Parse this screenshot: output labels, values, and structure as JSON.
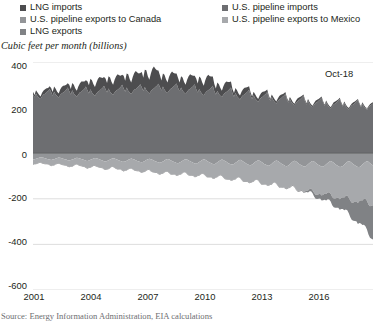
{
  "legend": {
    "items": [
      {
        "label": "LNG imports",
        "color": "#4d4d4f",
        "marker": "legend-swatch"
      },
      {
        "label": "U.S. pipeline exports to Canada",
        "color": "#939598",
        "marker": "legend-swatch"
      },
      {
        "label": "LNG exports",
        "color": "#808285",
        "marker": "legend-swatch"
      },
      {
        "label": "U.S. pipeline imports",
        "color": "#6d6e71",
        "marker": "legend-swatch"
      },
      {
        "label": "U.S. pipeline exports to Mexico",
        "color": "#a7a9ac",
        "marker": "legend-swatch"
      }
    ]
  },
  "axis_title": "Cubic feet per month (billions)",
  "annotation": "Oct-18",
  "source": "Source: Energy Information Administration, EIA calculations",
  "chart_data": {
    "type": "area",
    "stacked": true,
    "title": "",
    "subtitle": "",
    "xlabel": "",
    "ylabel": "Cubic feet per month (billions)",
    "ylim": [
      -600,
      400
    ],
    "xlim": [
      2001,
      2018.83
    ],
    "grid": true,
    "legend_position": "top",
    "ytick_labels": [
      "400",
      "200",
      "0",
      "-200",
      "-400",
      "-600"
    ],
    "ytick_values": [
      400,
      200,
      0,
      -200,
      -400,
      -600
    ],
    "xtick_labels": [
      "2001",
      "2004",
      "2007",
      "2010",
      "2013",
      "2016"
    ],
    "xtick_values": [
      2001,
      2004,
      2007,
      2010,
      2013,
      2016
    ],
    "annotations": [
      {
        "text": "Oct-18",
        "x": 2018.8,
        "y": 330
      }
    ],
    "colors": {
      "lng_imports": "#4d4d4f",
      "pipeline_imports": "#6d6e71",
      "pipeline_exports_canada": "#939598",
      "pipeline_exports_mexico": "#a7a9ac",
      "lng_exports": "#808285",
      "gridline": "#d9d9d9",
      "background": "#ffffff"
    },
    "series": [
      {
        "name": "U.S. pipeline imports",
        "sign": "positive",
        "units": "billion cubic feet per month",
        "values": [
          258,
          245,
          262,
          250,
          243,
          238,
          250,
          257,
          261,
          268,
          272,
          282,
          268,
          252,
          270,
          258,
          250,
          244,
          255,
          262,
          266,
          271,
          278,
          288,
          272,
          258,
          276,
          262,
          254,
          248,
          258,
          266,
          270,
          276,
          282,
          292,
          276,
          262,
          280,
          266,
          258,
          252,
          262,
          270,
          274,
          280,
          286,
          296,
          280,
          266,
          284,
          270,
          262,
          256,
          266,
          274,
          278,
          284,
          290,
          300,
          284,
          270,
          288,
          274,
          266,
          260,
          270,
          278,
          282,
          288,
          294,
          302,
          288,
          273,
          290,
          276,
          268,
          262,
          272,
          280,
          284,
          290,
          296,
          305,
          290,
          275,
          292,
          278,
          270,
          264,
          274,
          282,
          286,
          292,
          298,
          306,
          286,
          272,
          288,
          274,
          266,
          260,
          270,
          278,
          282,
          288,
          294,
          302,
          280,
          266,
          282,
          268,
          260,
          254,
          264,
          272,
          276,
          282,
          288,
          296,
          272,
          258,
          274,
          260,
          252,
          246,
          256,
          264,
          268,
          274,
          280,
          288,
          262,
          248,
          264,
          250,
          242,
          236,
          246,
          254,
          258,
          264,
          270,
          278,
          252,
          238,
          254,
          240,
          232,
          226,
          236,
          244,
          248,
          254,
          260,
          268,
          244,
          230,
          246,
          232,
          224,
          218,
          228,
          236,
          240,
          246,
          252,
          260,
          236,
          222,
          238,
          224,
          216,
          210,
          220,
          228,
          232,
          238,
          244,
          252,
          228,
          214,
          230,
          216,
          208,
          202,
          212,
          220,
          224,
          230,
          236,
          244,
          222,
          208,
          224,
          210,
          202,
          196,
          206,
          214,
          218,
          224,
          230,
          238,
          218,
          205,
          220,
          206,
          198,
          192,
          202,
          210,
          214,
          220,
          226,
          234,
          215,
          202,
          218,
          204,
          196,
          190,
          200,
          208,
          212,
          218
        ]
      },
      {
        "name": "LNG imports",
        "sign": "positive",
        "units": "billion cubic feet per month",
        "values": [
          12,
          10,
          14,
          16,
          13,
          11,
          15,
          18,
          20,
          17,
          14,
          12,
          18,
          16,
          22,
          25,
          20,
          18,
          24,
          28,
          30,
          26,
          22,
          19,
          28,
          24,
          32,
          38,
          30,
          26,
          34,
          40,
          44,
          38,
          32,
          28,
          40,
          36,
          46,
          54,
          44,
          38,
          48,
          56,
          60,
          52,
          44,
          38,
          48,
          42,
          54,
          62,
          50,
          44,
          56,
          64,
          68,
          58,
          50,
          44,
          56,
          48,
          62,
          72,
          58,
          50,
          64,
          74,
          78,
          66,
          56,
          50,
          68,
          58,
          76,
          88,
          70,
          60,
          78,
          90,
          96,
          80,
          68,
          58,
          52,
          44,
          58,
          66,
          54,
          46,
          60,
          68,
          72,
          60,
          52,
          44,
          44,
          38,
          50,
          58,
          46,
          40,
          52,
          60,
          64,
          54,
          46,
          38,
          48,
          40,
          54,
          62,
          50,
          42,
          56,
          64,
          68,
          56,
          48,
          40,
          32,
          26,
          36,
          42,
          34,
          28,
          38,
          44,
          46,
          38,
          32,
          26,
          20,
          16,
          22,
          26,
          20,
          17,
          23,
          27,
          29,
          24,
          20,
          16,
          14,
          11,
          16,
          19,
          15,
          12,
          17,
          20,
          21,
          17,
          14,
          11,
          10,
          8,
          12,
          14,
          11,
          9,
          12,
          15,
          16,
          13,
          10,
          8,
          8,
          6,
          9,
          11,
          8,
          7,
          10,
          12,
          12,
          10,
          8,
          6,
          7,
          5,
          8,
          9,
          7,
          6,
          8,
          10,
          10,
          8,
          7,
          5,
          6,
          5,
          7,
          8,
          6,
          5,
          7,
          9,
          9,
          7,
          6,
          5,
          6,
          4,
          7,
          8,
          6,
          5,
          7,
          8,
          9,
          7,
          6,
          4,
          5,
          4,
          6,
          7,
          5,
          4,
          6,
          7,
          8,
          6
        ]
      },
      {
        "name": "U.S. pipeline exports to Canada",
        "sign": "negative",
        "units": "billion cubic feet per month",
        "values": [
          -28,
          -26,
          -24,
          -22,
          -20,
          -18,
          -19,
          -20,
          -22,
          -24,
          -26,
          -28,
          -30,
          -28,
          -26,
          -23,
          -21,
          -19,
          -20,
          -22,
          -24,
          -26,
          -28,
          -31,
          -32,
          -30,
          -28,
          -25,
          -22,
          -20,
          -21,
          -23,
          -25,
          -28,
          -30,
          -33,
          -34,
          -32,
          -29,
          -26,
          -23,
          -21,
          -22,
          -24,
          -27,
          -30,
          -32,
          -35,
          -36,
          -34,
          -31,
          -28,
          -24,
          -22,
          -23,
          -26,
          -29,
          -32,
          -34,
          -37,
          -38,
          -36,
          -33,
          -29,
          -26,
          -23,
          -25,
          -28,
          -31,
          -34,
          -36,
          -39,
          -40,
          -38,
          -34,
          -30,
          -27,
          -24,
          -26,
          -29,
          -32,
          -36,
          -38,
          -41,
          -42,
          -40,
          -36,
          -32,
          -28,
          -25,
          -27,
          -31,
          -34,
          -38,
          -40,
          -43,
          -44,
          -41,
          -37,
          -33,
          -29,
          -26,
          -28,
          -32,
          -35,
          -39,
          -42,
          -45,
          -46,
          -43,
          -39,
          -34,
          -30,
          -27,
          -29,
          -33,
          -37,
          -41,
          -44,
          -47,
          -48,
          -45,
          -40,
          -35,
          -31,
          -28,
          -30,
          -34,
          -38,
          -43,
          -46,
          -49,
          -50,
          -47,
          -42,
          -37,
          -32,
          -29,
          -31,
          -36,
          -40,
          -45,
          -48,
          -52,
          -53,
          -50,
          -44,
          -39,
          -34,
          -31,
          -33,
          -38,
          -42,
          -47,
          -50,
          -54,
          -55,
          -52,
          -46,
          -40,
          -35,
          -32,
          -34,
          -39,
          -44,
          -49,
          -52,
          -56,
          -57,
          -54,
          -48,
          -42,
          -36,
          -33,
          -35,
          -41,
          -46,
          -51,
          -54,
          -58,
          -58,
          -55,
          -49,
          -43,
          -37,
          -34,
          -36,
          -42,
          -47,
          -52,
          -55,
          -59,
          -58,
          -55,
          -49,
          -43,
          -38,
          -34,
          -37,
          -42,
          -47,
          -53,
          -56,
          -60,
          -59,
          -56,
          -50,
          -44,
          -38,
          -35,
          -37,
          -43,
          -48,
          -53,
          -57,
          -61,
          -60,
          -57,
          -50,
          -44,
          -39,
          -35,
          -38,
          -44,
          -48,
          -54
        ]
      },
      {
        "name": "U.S. pipeline exports to Mexico",
        "sign": "negative",
        "units": "billion cubic feet per month",
        "values": [
          -22,
          -21,
          -23,
          -22,
          -21,
          -22,
          -24,
          -25,
          -24,
          -23,
          -22,
          -23,
          -25,
          -24,
          -26,
          -25,
          -24,
          -25,
          -27,
          -28,
          -27,
          -26,
          -25,
          -26,
          -28,
          -27,
          -29,
          -28,
          -27,
          -28,
          -30,
          -31,
          -30,
          -29,
          -28,
          -30,
          -32,
          -31,
          -33,
          -32,
          -31,
          -33,
          -35,
          -36,
          -35,
          -33,
          -32,
          -34,
          -36,
          -35,
          -37,
          -36,
          -35,
          -37,
          -40,
          -41,
          -40,
          -38,
          -36,
          -38,
          -40,
          -39,
          -41,
          -40,
          -40,
          -42,
          -45,
          -46,
          -45,
          -43,
          -41,
          -43,
          -45,
          -44,
          -46,
          -45,
          -45,
          -48,
          -52,
          -53,
          -51,
          -49,
          -47,
          -49,
          -50,
          -49,
          -52,
          -51,
          -51,
          -54,
          -58,
          -60,
          -58,
          -55,
          -53,
          -55,
          -52,
          -51,
          -54,
          -53,
          -53,
          -57,
          -62,
          -64,
          -62,
          -58,
          -56,
          -58,
          -56,
          -55,
          -58,
          -57,
          -58,
          -63,
          -68,
          -70,
          -68,
          -64,
          -61,
          -63,
          -62,
          -61,
          -64,
          -63,
          -64,
          -70,
          -76,
          -78,
          -75,
          -71,
          -68,
          -70,
          -68,
          -67,
          -71,
          -70,
          -72,
          -78,
          -85,
          -87,
          -84,
          -79,
          -76,
          -78,
          -76,
          -75,
          -79,
          -78,
          -80,
          -87,
          -95,
          -97,
          -94,
          -88,
          -85,
          -87,
          -86,
          -85,
          -90,
          -89,
          -92,
          -100,
          -108,
          -110,
          -106,
          -100,
          -96,
          -99,
          -98,
          -97,
          -102,
          -101,
          -104,
          -113,
          -122,
          -124,
          -120,
          -113,
          -109,
          -112,
          -110,
          -109,
          -115,
          -114,
          -118,
          -128,
          -138,
          -140,
          -135,
          -128,
          -123,
          -126,
          -124,
          -123,
          -130,
          -129,
          -133,
          -144,
          -155,
          -157,
          -152,
          -144,
          -139,
          -142,
          -138,
          -137,
          -144,
          -143,
          -148,
          -160,
          -172,
          -174,
          -168,
          -160,
          -154,
          -157,
          -150,
          -149,
          -157,
          -156,
          -161,
          -174,
          -187,
          -189,
          -183,
          -174
        ]
      },
      {
        "name": "LNG exports",
        "sign": "negative",
        "units": "billion cubic feet per month",
        "values": [
          -2,
          -2,
          -2,
          -2,
          -2,
          -2,
          -2,
          -2,
          -2,
          -2,
          -2,
          -2,
          -2,
          -2,
          -2,
          -2,
          -2,
          -2,
          -2,
          -2,
          -2,
          -2,
          -2,
          -2,
          -2,
          -2,
          -2,
          -2,
          -2,
          -2,
          -2,
          -2,
          -2,
          -2,
          -2,
          -2,
          -2,
          -2,
          -2,
          -2,
          -2,
          -2,
          -2,
          -2,
          -2,
          -2,
          -2,
          -2,
          -2,
          -2,
          -2,
          -2,
          -2,
          -2,
          -2,
          -2,
          -2,
          -2,
          -2,
          -2,
          -2,
          -2,
          -2,
          -2,
          -2,
          -2,
          -2,
          -2,
          -2,
          -2,
          -2,
          -2,
          -2,
          -2,
          -2,
          -2,
          -2,
          -2,
          -2,
          -2,
          -2,
          -2,
          -2,
          -2,
          -2,
          -2,
          -2,
          -2,
          -2,
          -2,
          -2,
          -2,
          -2,
          -2,
          -2,
          -2,
          -2,
          -2,
          -2,
          -2,
          -2,
          -2,
          -2,
          -2,
          -2,
          -2,
          -2,
          -2,
          -2,
          -2,
          -2,
          -2,
          -2,
          -2,
          -2,
          -2,
          -2,
          -2,
          -2,
          -2,
          -2,
          -2,
          -2,
          -2,
          -2,
          -2,
          -2,
          -2,
          -2,
          -2,
          -2,
          -2,
          -2,
          -2,
          -2,
          -2,
          -2,
          -2,
          -2,
          -2,
          -2,
          -2,
          -2,
          -2,
          -2,
          -2,
          -2,
          -2,
          -2,
          -2,
          -2,
          -2,
          -2,
          -2,
          -2,
          -2,
          -2,
          -2,
          -2,
          -2,
          -2,
          -2,
          -2,
          -2,
          -2,
          -2,
          -2,
          -2,
          -3,
          -3,
          -3,
          -3,
          -3,
          -3,
          -3,
          -3,
          -3,
          -3,
          -3,
          -3,
          -4,
          -6,
          -8,
          -10,
          -12,
          -14,
          -16,
          -18,
          -19,
          -20,
          -21,
          -22,
          -24,
          -26,
          -28,
          -30,
          -32,
          -34,
          -36,
          -38,
          -40,
          -42,
          -44,
          -46,
          -48,
          -52,
          -56,
          -60,
          -64,
          -68,
          -72,
          -76,
          -80,
          -84,
          -88,
          -92,
          -96,
          -102,
          -108,
          -114,
          -120,
          -126,
          -132,
          -138,
          -144,
          -150
        ]
      }
    ]
  }
}
